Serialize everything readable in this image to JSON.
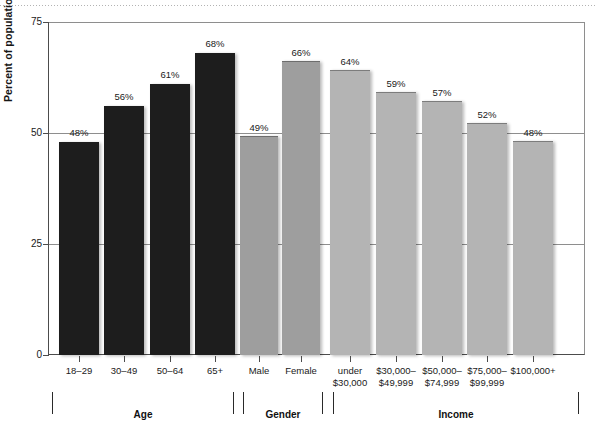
{
  "chart_data": {
    "type": "bar",
    "title": "",
    "xlabel": "",
    "ylabel": "Percent of population reporting daily prayer",
    "ylim": [
      0,
      75
    ],
    "yticks": [
      0,
      25,
      50,
      75
    ],
    "ytick_labels": [
      "0",
      "25",
      "50",
      "75"
    ],
    "grid": true,
    "legend": "none",
    "value_suffix": "%",
    "categories": [
      "18–29",
      "30–49",
      "50–64",
      "65+",
      "Male",
      "Female",
      "under $30,000",
      "$30,000–$49,999",
      "$50,000–$74,999",
      "$75,000–$99,999",
      "$100,000+"
    ],
    "values": [
      48,
      56,
      61,
      68,
      49,
      66,
      64,
      59,
      57,
      52,
      48
    ],
    "data_labels": [
      "48%",
      "56%",
      "61%",
      "68%",
      "49%",
      "66%",
      "64%",
      "59%",
      "57%",
      "52%",
      "48%"
    ],
    "groups": [
      {
        "name": "Age",
        "categories": [
          "18–29",
          "30–49",
          "50–64",
          "65+"
        ],
        "color": "#1d1d1d"
      },
      {
        "name": "Gender",
        "categories": [
          "Male",
          "Female"
        ],
        "color": "#9e9e9e"
      },
      {
        "name": "Income",
        "categories": [
          "under $30,000",
          "$30,000–$49,999",
          "$50,000–$74,999",
          "$75,000–$99,999",
          "$100,000+"
        ],
        "color": "#b4b4b4"
      }
    ],
    "bars": [
      {
        "label": "18–29",
        "label_lines": [
          "18–29"
        ],
        "value": 48,
        "data_label": "48%",
        "group": "Age",
        "shade": "dark"
      },
      {
        "label": "30–49",
        "label_lines": [
          "30–49"
        ],
        "value": 56,
        "data_label": "56%",
        "group": "Age",
        "shade": "dark"
      },
      {
        "label": "50–64",
        "label_lines": [
          "50–64"
        ],
        "value": 61,
        "data_label": "61%",
        "group": "Age",
        "shade": "dark"
      },
      {
        "label": "65+",
        "label_lines": [
          "65+"
        ],
        "value": 68,
        "data_label": "68%",
        "group": "Age",
        "shade": "dark"
      },
      {
        "label": "Male",
        "label_lines": [
          "Male"
        ],
        "value": 49,
        "data_label": "49%",
        "group": "Gender",
        "shade": "mid"
      },
      {
        "label": "Female",
        "label_lines": [
          "Female"
        ],
        "value": 66,
        "data_label": "66%",
        "group": "Gender",
        "shade": "mid"
      },
      {
        "label": "under $30,000",
        "label_lines": [
          "under",
          "$30,000"
        ],
        "value": 64,
        "data_label": "64%",
        "group": "Income",
        "shade": "light"
      },
      {
        "label": "$30,000–$49,999",
        "label_lines": [
          "$30,000–",
          "$49,999"
        ],
        "value": 59,
        "data_label": "59%",
        "group": "Income",
        "shade": "light"
      },
      {
        "label": "$50,000–$74,999",
        "label_lines": [
          "$50,000–",
          "$74,999"
        ],
        "value": 57,
        "data_label": "57%",
        "group": "Income",
        "shade": "light"
      },
      {
        "label": "$75,000–$99,999",
        "label_lines": [
          "$75,000–",
          "$99,999"
        ],
        "value": 52,
        "data_label": "52%",
        "group": "Income",
        "shade": "light"
      },
      {
        "label": "$100,000+",
        "label_lines": [
          "$100,000+"
        ],
        "value": 48,
        "data_label": "48%",
        "group": "Income",
        "shade": "light"
      }
    ],
    "colors": {
      "age_bars": "#1d1d1d",
      "gender_bars": "#9e9e9e",
      "income_bars": "#b4b4b4",
      "gridline": "#8e8e8e",
      "axis": "#4c4c4c",
      "text": "#1a1a1a",
      "background": "#ffffff"
    }
  }
}
